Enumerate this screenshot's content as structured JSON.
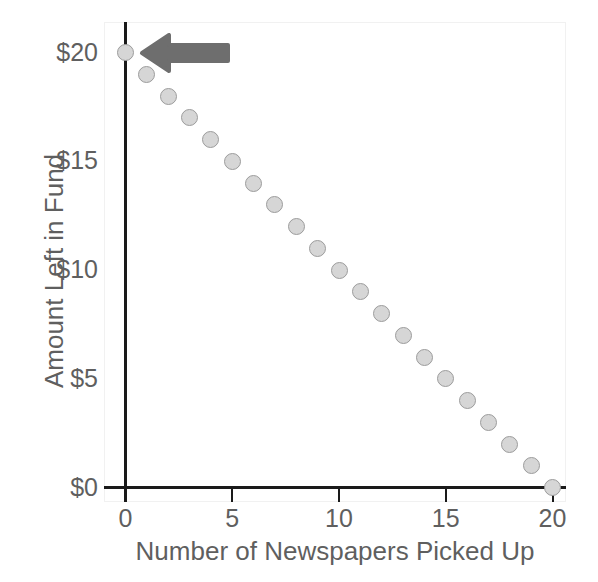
{
  "chart_data": {
    "type": "scatter",
    "title": "",
    "xlabel": "Number of Newspapers Picked Up",
    "ylabel": "Amount Left in Fund",
    "xlim": [
      -1,
      21.6
    ],
    "ylim": [
      -0.75,
      21.4
    ],
    "grid": false,
    "legend": null,
    "x": [
      0,
      1,
      2,
      3,
      4,
      5,
      6,
      7,
      8,
      9,
      10,
      11,
      12,
      13,
      14,
      15,
      16,
      17,
      18,
      19,
      20
    ],
    "values": [
      20,
      19,
      18,
      17,
      16,
      15,
      14,
      13,
      12,
      11,
      10,
      9,
      8,
      7,
      6,
      5,
      4,
      3,
      2,
      1,
      0
    ],
    "xticks": [
      0,
      5,
      10,
      15,
      20
    ],
    "xticklabels": [
      "0",
      "5",
      "10",
      "15",
      "20"
    ],
    "yticks": [
      0,
      5,
      10,
      15,
      20
    ],
    "yticklabels": [
      "$0",
      "$5",
      "$10",
      "$15",
      "$20"
    ],
    "annotations": [
      {
        "name": "left-arrow",
        "points_to_x": 0,
        "points_to_y": 20,
        "direction": "left",
        "color": "#6e6e6e",
        "text": ""
      }
    ],
    "marker_fill": "#d6d6d6",
    "marker_stroke": "#9c9c9c",
    "axis_color": "#1a1a1a",
    "text_color": "#5f5f5f",
    "background": "#ffffff"
  }
}
